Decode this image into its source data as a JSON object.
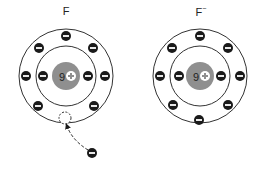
{
  "diagram": {
    "atoms": [
      {
        "id": "fluorine-atom",
        "label": "F",
        "charge_superscript": "",
        "nucleus_text": "9",
        "nucleus_sign": "+",
        "center": [
          66,
          76
        ],
        "inner_shell_electrons": 2,
        "outer_shell_electrons": 7,
        "vacancy": true
      },
      {
        "id": "fluoride-ion",
        "label": "F",
        "charge_superscript": "−",
        "nucleus_text": "9",
        "nucleus_sign": "+",
        "center": [
          200,
          76
        ],
        "inner_shell_electrons": 2,
        "outer_shell_electrons": 8,
        "vacancy": false
      }
    ],
    "free_electron": {
      "sign": "−",
      "position": [
        92,
        153
      ],
      "arrow_to": [
        66,
        124
      ]
    },
    "colors": {
      "nucleus": "#8f8f8f",
      "electron": "#1a1a1a",
      "shell": "#333333",
      "background": "#ffffff"
    }
  }
}
